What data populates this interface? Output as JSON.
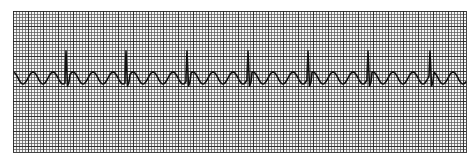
{
  "strip": {
    "type": "ecg-rhythm-strip",
    "background_color": "#f4f4f4",
    "grid_color": "#333333",
    "trace_color": "#111111",
    "baseline_y": 78,
    "spike_peak_y": 51,
    "spike_x": [
      66,
      126,
      187,
      248,
      308,
      368,
      430
    ],
    "wave": "sinusoidal-undulating"
  }
}
